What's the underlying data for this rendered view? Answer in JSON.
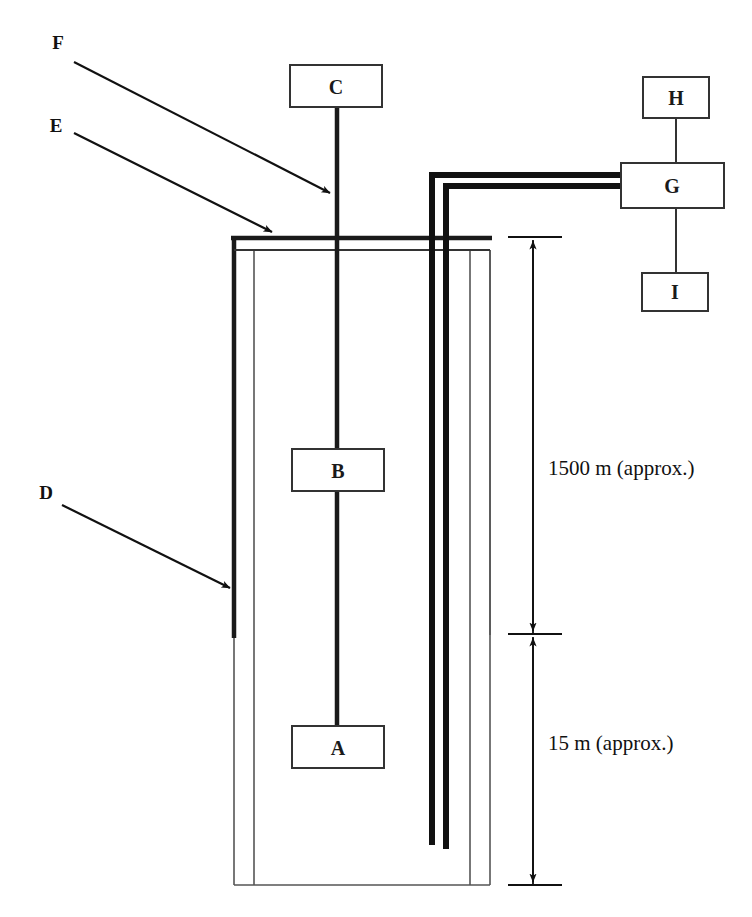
{
  "figure": {
    "type": "schematic-diagram"
  },
  "component_boxes": [
    {
      "id": "C",
      "label": "C",
      "x": 290,
      "y": 65,
      "w": 92,
      "h": 42
    },
    {
      "id": "B",
      "label": "B",
      "x": 292,
      "y": 449,
      "w": 92,
      "h": 42
    },
    {
      "id": "A",
      "label": "A",
      "x": 292,
      "y": 726,
      "w": 92,
      "h": 42
    },
    {
      "id": "H",
      "label": "H",
      "x": 643,
      "y": 77,
      "w": 66,
      "h": 41
    },
    {
      "id": "G",
      "label": "G",
      "x": 621,
      "y": 163,
      "w": 103,
      "h": 45
    },
    {
      "id": "I",
      "label": "I",
      "x": 642,
      "y": 273,
      "w": 66,
      "h": 38
    }
  ],
  "callouts": [
    {
      "id": "F",
      "label": "F",
      "label_x": 58,
      "label_y": 42,
      "line_start_x": 74,
      "line_start_y": 62,
      "line_end_x": 330,
      "line_end_y": 193
    },
    {
      "id": "E",
      "label": "E",
      "label_x": 56,
      "label_y": 125,
      "line_start_x": 74,
      "line_start_y": 133,
      "line_end_x": 272,
      "line_end_y": 232
    },
    {
      "id": "D",
      "label": "D",
      "label_x": 46,
      "label_y": 492,
      "line_start_x": 62,
      "line_start_y": 505,
      "line_end_x": 230,
      "line_end_y": 588
    }
  ],
  "dimensions": [
    {
      "id": "upper-depth",
      "label": "1500 m (approx.)",
      "label_x": 548,
      "label_y": 468,
      "line_x": 533,
      "top_y": 237,
      "bottom_y": 634,
      "tick_top_x1": 508,
      "tick_top_x2": 562,
      "tick_bottom_x1": 508,
      "tick_bottom_x2": 562
    },
    {
      "id": "lower-depth",
      "label": "15 m (approx.)",
      "label_x": 548,
      "label_y": 743,
      "line_x": 533,
      "top_y": 634,
      "bottom_y": 885,
      "tick_top_x1": 508,
      "tick_top_x2": 562,
      "tick_bottom_x1": 508,
      "tick_bottom_x2": 562
    }
  ],
  "geometry": {
    "wellhead_cap": {
      "left_x": 234,
      "right_x": 490,
      "top_y": 237,
      "bottom_y": 250
    },
    "outer_borehole": {
      "left_x": 234,
      "right_x": 490,
      "top_y": 250,
      "bottom_y": 885
    },
    "inner_casing_left_x": 254,
    "inner_casing_right_x": 470,
    "inner_casing_bottom_y": 885,
    "outer_casing_left": {
      "x": 234,
      "top_y": 237,
      "bottom_y": 638
    },
    "outer_casing_right": {
      "x": 490,
      "top_y": 250,
      "bottom_y": 635
    },
    "central_rod": {
      "x": 337,
      "top_y": 107,
      "bottom_y": 726
    },
    "tubing_pipe": {
      "outer_vertical_x": 432,
      "inner_vertical_x": 446,
      "outer_horizontal_y": 175,
      "inner_horizontal_y": 186,
      "horizontal_end_x": 622,
      "outer_bottom_y": 845,
      "inner_bottom_y": 849,
      "corner_outer_y": 175,
      "corner_inner_y": 186
    },
    "links": [
      {
        "id": "C-to-wellhead",
        "x": 337,
        "y1": 107,
        "y2": 244
      },
      {
        "id": "H-to-G",
        "x": 676,
        "y1": 118,
        "y2": 163
      },
      {
        "id": "G-to-I",
        "x": 676,
        "y1": 208,
        "y2": 273
      },
      {
        "id": "B-to-A",
        "x": 337,
        "y1": 491,
        "y2": 726
      }
    ]
  }
}
